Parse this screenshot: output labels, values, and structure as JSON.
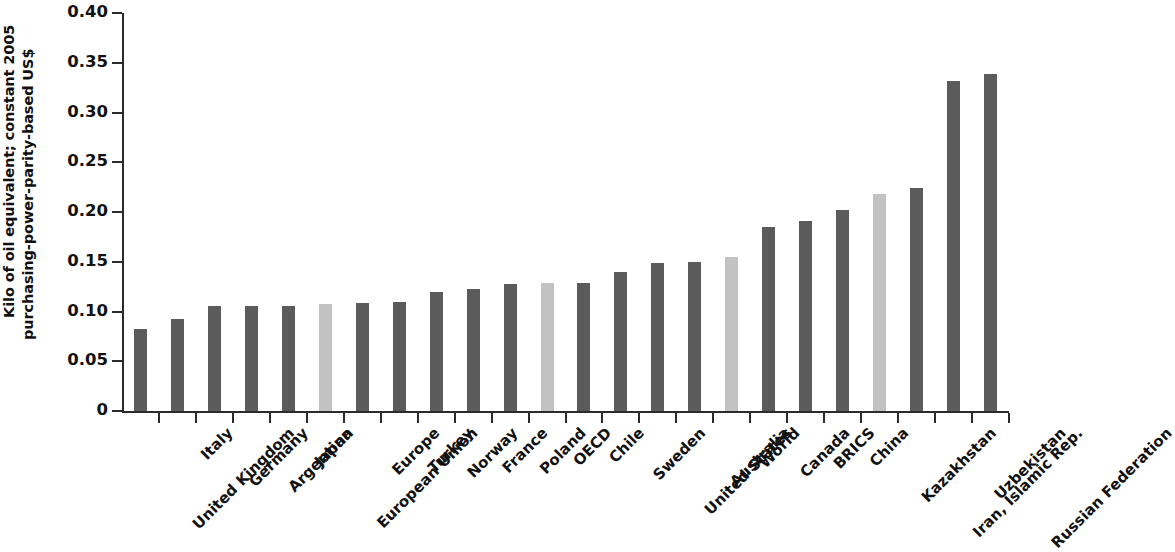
{
  "chart_data": {
    "type": "bar",
    "title": "",
    "xlabel": "",
    "ylabel": "Kilo of oil equivalent; constant 2005 purchasing-power-parity-based US$",
    "ylabel_lines": [
      "Kilo of oil equivalent; constant 2005",
      "purchasing-power-parity-based US$"
    ],
    "ylim": [
      0,
      0.4
    ],
    "ytick_labels": [
      "0.40",
      "0.35",
      "0.30",
      "0.25",
      "0.20",
      "0.15",
      "0.10",
      "0.05",
      "0"
    ],
    "ytick_values": [
      0.4,
      0.35,
      0.3,
      0.25,
      0.2,
      0.15,
      0.1,
      0.05,
      0
    ],
    "grid": false,
    "legend": "none",
    "bar_color_primary": "#5b5b5b",
    "bar_color_highlight": "#c2c2c2",
    "categories": [
      "United Kingdom",
      "Italy",
      "Germany",
      "Argentina",
      "Japan",
      "European Union",
      "Europe",
      "Turkey",
      "Norway",
      "France",
      "Poland",
      "OECD",
      "Chile",
      "Sweden",
      "United States",
      "Australia",
      "World",
      "Canada",
      "BRICS",
      "China",
      "Kazakhstan",
      "Iran, Islamic Rep.",
      "Uzbekistan",
      "Russian Federation"
    ],
    "values": [
      0.082,
      0.092,
      0.106,
      0.106,
      0.106,
      0.108,
      0.109,
      0.11,
      0.12,
      0.123,
      0.128,
      0.129,
      0.129,
      0.14,
      0.149,
      0.15,
      0.155,
      0.185,
      0.191,
      0.202,
      0.218,
      0.224,
      0.332,
      0.339
    ],
    "highlighted": [
      false,
      false,
      false,
      false,
      false,
      true,
      false,
      false,
      false,
      false,
      false,
      true,
      false,
      false,
      false,
      false,
      true,
      false,
      false,
      false,
      true,
      false,
      false,
      false
    ]
  }
}
